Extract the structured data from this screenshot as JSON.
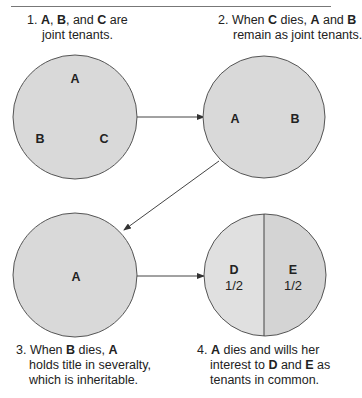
{
  "diagram": {
    "colors": {
      "circle_fill": "#d9d9d9",
      "circle_fill_light": "#e0e0e0",
      "circle_fill_dark": "#d4d4d4",
      "stroke": "#555555",
      "text": "#222222"
    },
    "steps": [
      {
        "caption": {
          "number": "1.",
          "parts": [
            "A",
            ", ",
            "B",
            ", and ",
            "C",
            " are"
          ],
          "line2": "joint tenants."
        },
        "circle_labels": [
          "A",
          "B",
          "C"
        ]
      },
      {
        "caption": {
          "number": "2.",
          "line1_a": "When ",
          "line1_b": "C",
          "line1_c": " dies, ",
          "line1_d": "A",
          "line1_e": " and ",
          "line1_f": "B",
          "line2": "remain as joint tenants."
        },
        "circle_labels": [
          "A",
          "B"
        ]
      },
      {
        "caption": {
          "number": "3.",
          "line1_a": "When ",
          "line1_b": "B",
          "line1_c": " dies, ",
          "line1_d": "A",
          "line2": "holds title in severalty,",
          "line3": "which is inheritable."
        },
        "circle_labels": [
          "A"
        ]
      },
      {
        "caption": {
          "number": "4.",
          "line1_a": "A",
          "line1_b": " dies and wills her",
          "line2_a": "interest to ",
          "line2_b": "D",
          "line2_c": " and ",
          "line2_d": "E",
          "line2_e": " as",
          "line3": "tenants in common."
        },
        "circle_labels": [
          "D",
          "E"
        ],
        "shares": [
          "1/2",
          "1/2"
        ]
      }
    ]
  }
}
